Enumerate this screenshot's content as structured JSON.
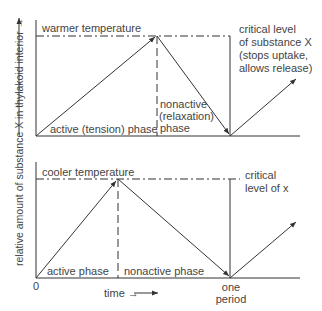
{
  "y_axis_label": "relative amount of substance X in thylakoid interior →",
  "x_axis": {
    "origin": "0",
    "label": "time →",
    "period_label": "one period"
  },
  "top_panel": {
    "threshold_label": "warmer temperature",
    "active_phase_label": "active (tension) phase",
    "nonactive_phase_label_1": "nonactive",
    "nonactive_phase_label_2": "(relaxation)",
    "nonactive_phase_label_3": "phase",
    "critical_label_1": "critical level",
    "critical_label_2": "of substance X",
    "critical_label_3": "(stops uptake,",
    "critical_label_4": "allows release)"
  },
  "bottom_panel": {
    "threshold_label": "cooler temperature",
    "active_phase_label": "active phase",
    "nonactive_phase_label": "nonactive phase",
    "critical_label_1": "critical",
    "critical_label_2": "level of x"
  },
  "colors": {
    "line": "#333333",
    "text": "#444444",
    "background": "#ffffff"
  }
}
